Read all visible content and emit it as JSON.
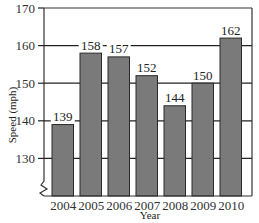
{
  "chart_data": {
    "type": "bar",
    "title": "",
    "xlabel": "Year",
    "ylabel": "Speed (mph)",
    "categories": [
      "2004",
      "2005",
      "2006",
      "2007",
      "2008",
      "2009",
      "2010"
    ],
    "values": [
      139,
      158,
      157,
      152,
      144,
      150,
      162
    ],
    "data_labels": [
      "139",
      "158",
      "157",
      "152",
      "144",
      "150",
      "162"
    ],
    "ylim": [
      120,
      170
    ],
    "yticks": [
      130,
      140,
      150,
      160,
      170
    ],
    "ytick_labels": [
      "130",
      "140",
      "150",
      "160",
      "170"
    ],
    "axis_break": true,
    "grid": "horizontal",
    "legend": null,
    "colors": {
      "bar": "#7a7a7a",
      "bar_edge": "#2a2a2a",
      "grid": "#222222",
      "frame": "#333333"
    }
  }
}
